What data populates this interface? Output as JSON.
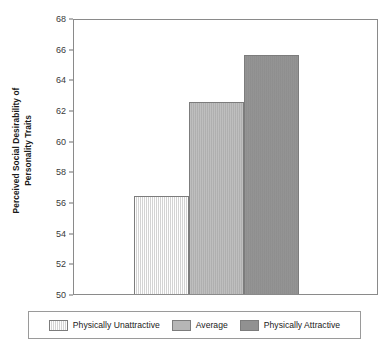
{
  "chart_data": {
    "type": "bar",
    "title": "",
    "xlabel": "",
    "ylabel": "Perceived Social Desirability of Personality Traits",
    "ylabel_lines": [
      "Perceived Social Desirability of",
      "Personality Traits"
    ],
    "categories": [
      "Physically Unattractive",
      "Average",
      "Physically Attractive"
    ],
    "values": [
      56.4,
      62.5,
      65.6
    ],
    "series": [
      {
        "name": "Perceived Social Desirability of Personality Traits",
        "values": [
          56.4,
          62.5,
          65.6
        ]
      }
    ],
    "ylim": [
      50,
      68
    ],
    "yticks": [
      50,
      52,
      54,
      56,
      58,
      60,
      62,
      64,
      66,
      68
    ],
    "ytick_labels": [
      "50",
      "52",
      "54",
      "56",
      "58",
      "60",
      "62",
      "64",
      "66",
      "68"
    ],
    "xtick_labels": [],
    "grid": false,
    "legend_position": "bottom",
    "legend_entries": [
      {
        "label": "Physically Unattractive",
        "color": "#e6e6e6"
      },
      {
        "label": "Average",
        "color": "#b6b6b6"
      },
      {
        "label": "Physically Attractive",
        "color": "#919191"
      }
    ],
    "colors": [
      "#e6e6e6",
      "#b6b6b6",
      "#919191"
    ],
    "bar_edge_color": "#7c7c7c",
    "axis_color": "#8a8a8a",
    "background": "#ffffff"
  }
}
